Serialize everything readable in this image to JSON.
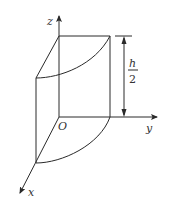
{
  "diagram": {
    "type": "3d-solid-quarter-cylinder-with-curved-top",
    "stroke_color": "#2a2a2a",
    "axes": {
      "x": {
        "label": "x"
      },
      "y": {
        "label": "y"
      },
      "z": {
        "label": "z"
      },
      "origin": {
        "label": "O"
      }
    },
    "dimension": {
      "numerator": "h",
      "denominator": "2",
      "description": "height dimension h/2 on right edge"
    }
  }
}
